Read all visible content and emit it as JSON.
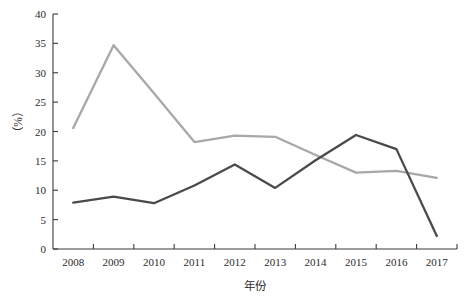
{
  "chart_data": {
    "type": "line",
    "title": "",
    "xlabel": "年份",
    "ylabel": "（%）",
    "categories": [
      "2008",
      "2009",
      "2010",
      "2011",
      "2012",
      "2013",
      "2014",
      "2015",
      "2016",
      "2017"
    ],
    "x": [
      2008,
      2009,
      2010,
      2011,
      2012,
      2013,
      2014,
      2015,
      2016,
      2017
    ],
    "series": [
      {
        "name": "series-light",
        "color": "#a8a8a8",
        "values": [
          20.6,
          34.7,
          26.5,
          18.2,
          19.3,
          19.1,
          16.0,
          13.0,
          13.3,
          12.1
        ]
      },
      {
        "name": "series-dark",
        "color": "#4a4a4a",
        "values": [
          7.9,
          8.9,
          7.8,
          10.8,
          14.4,
          10.4,
          15.1,
          19.4,
          17.0,
          2.2
        ]
      }
    ],
    "ylim": [
      0,
      40
    ],
    "yticks": [
      0,
      5,
      10,
      15,
      20,
      25,
      30,
      35,
      40
    ],
    "ytick_labels": [
      "0",
      "5",
      "10",
      "15",
      "20",
      "25",
      "30",
      "35",
      "40"
    ],
    "grid": false,
    "legend": "none",
    "axis_color": "#3a3a3a"
  },
  "axes": {
    "y_label_text": "（%）",
    "x_label_text": "年份"
  }
}
